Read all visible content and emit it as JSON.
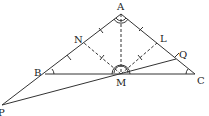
{
  "diagram": {
    "type": "geometry",
    "points": {
      "A": {
        "label": "A",
        "x": 121,
        "y": 14
      },
      "B": {
        "label": "B",
        "x": 45,
        "y": 74
      },
      "C": {
        "label": "C",
        "x": 195,
        "y": 74
      },
      "M": {
        "label": "M",
        "x": 121,
        "y": 74
      },
      "N": {
        "label": "N",
        "x": 84,
        "y": 43
      },
      "L": {
        "label": "L",
        "x": 157,
        "y": 43
      },
      "Q": {
        "label": "Q",
        "x": 176,
        "y": 59
      },
      "P": {
        "label": "P",
        "x": 2,
        "y": 105
      }
    },
    "segments_solid": [
      "AB",
      "AC",
      "BC",
      "PA",
      "PQ"
    ],
    "segments_dashed": [
      "AM",
      "MN",
      "ML"
    ],
    "colors": {
      "line": "#333333",
      "text": "#222222"
    }
  }
}
